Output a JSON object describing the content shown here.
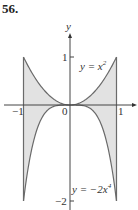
{
  "problem_number": "56.",
  "chart_data": {
    "type": "area",
    "title": "",
    "xlabel": "",
    "ylabel": "y",
    "x_ticks": [
      "-1",
      "0",
      "1"
    ],
    "y_ticks": [
      "1",
      "-2"
    ],
    "xlim": [
      -1,
      1
    ],
    "ylim": [
      -2,
      1
    ],
    "grid": false,
    "series": [
      {
        "name": "y = x²",
        "function": "x^2",
        "x": [
          -1,
          -0.5,
          0,
          0.5,
          1
        ],
        "values": [
          1,
          0.25,
          0,
          0.25,
          1
        ]
      },
      {
        "name": "y = −2x⁴",
        "function": "-2x^4",
        "x": [
          -1,
          -0.5,
          0,
          0.5,
          1
        ],
        "values": [
          -2,
          -0.125,
          0,
          -0.125,
          -2
        ]
      }
    ],
    "shaded_region": "between y = x² and y = −2x⁴ for −1 ≤ x ≤ 1",
    "annotations": [
      "y = x²",
      "y = −2x⁴"
    ]
  },
  "labels": {
    "y_axis": "y",
    "tick_neg1": "−1",
    "tick_zero": "0",
    "tick_pos1": "1",
    "tick_y1": "1",
    "tick_yneg2": "−2",
    "curve_top_y": "y = x",
    "curve_top_exp": "2",
    "curve_bottom_y": "y = −2x",
    "curve_bottom_exp": "4"
  },
  "colors": {
    "fill": "#e2e2e2",
    "curve": "#6a6a6a",
    "axis": "#444444"
  }
}
